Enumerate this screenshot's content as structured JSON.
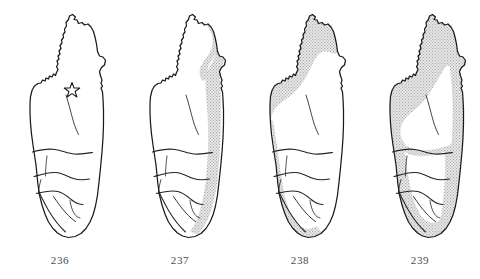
{
  "figure": {
    "kind": "distribution-map-plate",
    "background_color": "#ffffff",
    "outline_color": "#1a1a1a",
    "river_color": "#242424",
    "stipple_color": "#b9b9b9",
    "stipple_base_color": "#dedede",
    "caption_color": "#4a4a4a",
    "panel_count": 4
  },
  "panels": [
    {
      "caption": "236",
      "region_label": "no shaded range",
      "has_shading": false,
      "marker": {
        "type": "star-marker",
        "label": "type locality",
        "x": 72,
        "y": 89
      }
    },
    {
      "caption": "237",
      "region_label": "eastern coastal band",
      "has_shading": true,
      "marker": null
    },
    {
      "caption": "238",
      "region_label": "western and northern band",
      "has_shading": true,
      "marker": null
    },
    {
      "caption": "239",
      "region_label": "peripheral band with unshaded central highlands",
      "has_shading": true,
      "marker": null
    }
  ]
}
